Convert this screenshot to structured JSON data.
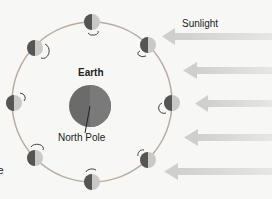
{
  "labels": {
    "earth": "Earth",
    "north_pole": "North Pole",
    "sunlight": "Sunlight",
    "cut_off_text": "e"
  },
  "colors": {
    "background": "#f7f7f6",
    "orbit": "#b8aca4",
    "earth": "#666666",
    "arrow": "#d4d4d4",
    "moon_dark": "#555555",
    "moon_light": "#c9c9c9"
  },
  "moons": [
    {
      "position": "top",
      "x": 92,
      "y": 22
    },
    {
      "position": "top-right",
      "x": 148,
      "y": 45
    },
    {
      "position": "right",
      "x": 172,
      "y": 103
    },
    {
      "position": "bottom-right",
      "x": 148,
      "y": 160
    },
    {
      "position": "bottom",
      "x": 92,
      "y": 182
    },
    {
      "position": "bottom-left",
      "x": 35,
      "y": 158
    },
    {
      "position": "left",
      "x": 14,
      "y": 103
    },
    {
      "position": "top-left",
      "x": 35,
      "y": 48
    }
  ],
  "sunlight_arrows": 5
}
